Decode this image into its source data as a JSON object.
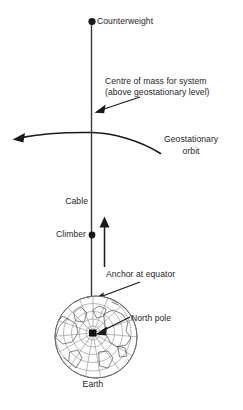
{
  "diagram": {
    "background_color": "#ffffff",
    "line_color": "#262626",
    "text_color": "#262626",
    "labels": {
      "counterweight": "Counterweight",
      "centre_of_mass_line1": "Centre of mass for system",
      "centre_of_mass_line2": "(above geostationary level)",
      "geostationary_line1": "Geostationary",
      "geostationary_line2": "orbit",
      "cable": "Cable",
      "climber": "Climber",
      "anchor": "Anchor at equator",
      "north_pole": "North pole",
      "earth": "Earth"
    },
    "markers": {
      "counterweight_dot": "filled-circle",
      "climber_dot": "filled-circle",
      "north_pole_dot": "filled-square"
    },
    "arrows": {
      "centre_of_mass": "arrow-down-left",
      "geostationary_orbit": "curved-arrow-left",
      "climber_direction": "arrow-up",
      "anchor": "arrow-down-left",
      "north_pole": "arrow-left"
    },
    "globe": {
      "projection": "polar-azimuthal",
      "graticule": "latitude-longitude-grid"
    }
  }
}
